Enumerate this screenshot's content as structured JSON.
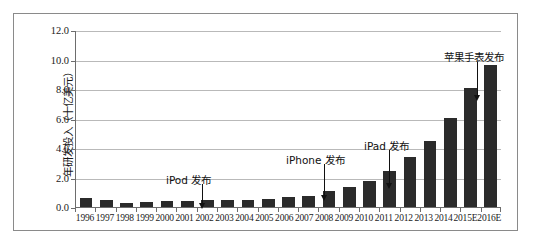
{
  "chart_data": {
    "type": "bar",
    "title": "",
    "xlabel": "",
    "ylabel": "年研发投入（十亿美元）",
    "ylim": [
      0,
      12
    ],
    "yticks": [
      "0.0",
      "2.0",
      "4.0",
      "6.0",
      "8.0",
      "10.0",
      "12.0"
    ],
    "ytick_values": [
      0,
      2,
      4,
      6,
      8,
      10,
      12
    ],
    "grid": true,
    "legend": "none",
    "bar_color": "#2b2b2b",
    "categories": [
      "1996",
      "1997",
      "1998",
      "1999",
      "2000",
      "2001",
      "2002",
      "2003",
      "2004",
      "2005",
      "2006",
      "2007",
      "2008",
      "2009",
      "2010",
      "2011",
      "2012",
      "2013",
      "2014",
      "2015E",
      "2016E"
    ],
    "values": [
      0.6,
      0.5,
      0.3,
      0.31,
      0.38,
      0.43,
      0.45,
      0.47,
      0.49,
      0.53,
      0.71,
      0.78,
      1.11,
      1.33,
      1.78,
      2.43,
      3.38,
      4.48,
      6.04,
      8.07,
      9.6
    ],
    "annotations": [
      {
        "label": "iPod 发布",
        "category": "2001",
        "text_x": 152,
        "text_y": 158,
        "arrow_x": 188,
        "arrow_top": 170,
        "arrow_len": 24
      },
      {
        "label": "iPhone 发布",
        "category": "2007",
        "text_x": 272,
        "text_y": 138,
        "arrow_x": 310,
        "arrow_top": 150,
        "arrow_len": 36
      },
      {
        "label": "iPad 发布",
        "category": "2010",
        "text_x": 350,
        "text_y": 124,
        "arrow_x": 375,
        "arrow_top": 136,
        "arrow_len": 38
      },
      {
        "label": "苹果手表发布",
        "category": "2015E",
        "text_x": 430,
        "text_y": 35,
        "arrow_x": 463,
        "arrow_top": 48,
        "arrow_len": 38
      }
    ]
  }
}
